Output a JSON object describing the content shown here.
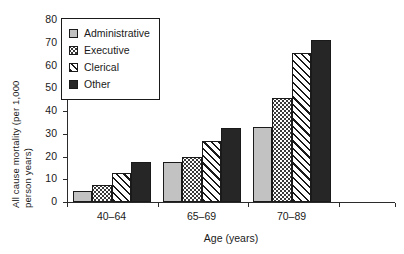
{
  "chart_data": {
    "type": "bar",
    "title": "",
    "xlabel": "Age (years)",
    "ylabel": "All cause mortality (per 1,000 person years)",
    "ylabel_line1": "All cause mortality (per 1,000",
    "ylabel_line2": "person years)",
    "categories": [
      "40–64",
      "65–69",
      "70–89"
    ],
    "ylim": [
      0,
      80
    ],
    "yticks": [
      0,
      10,
      20,
      30,
      40,
      50,
      60,
      70,
      80
    ],
    "ytick_labels": [
      "0",
      "10",
      "20",
      "30",
      "40",
      "50",
      "60",
      "70",
      "80"
    ],
    "grid": false,
    "legend_position": "upper-left-inside",
    "series": [
      {
        "name": "Administrative",
        "pattern": "solid-light-gray",
        "color": "#c2c2c2",
        "values": [
          4.8,
          17.6,
          33.0
        ]
      },
      {
        "name": "Executive",
        "pattern": "dotted",
        "color": "#ffffff",
        "values": [
          7.6,
          20.0,
          45.7
        ]
      },
      {
        "name": "Clerical",
        "pattern": "diagonal-hatch",
        "color": "#ffffff",
        "values": [
          12.7,
          27.0,
          65.5
        ]
      },
      {
        "name": "Other",
        "pattern": "solid-black",
        "color": "#262626",
        "values": [
          17.6,
          32.5,
          71.0
        ]
      }
    ]
  },
  "legend": {
    "items": [
      {
        "label": "Administrative",
        "swatch": "swatch-administrative"
      },
      {
        "label": "Executive",
        "swatch": "swatch-executive"
      },
      {
        "label": "Clerical",
        "swatch": "swatch-clerical"
      },
      {
        "label": "Other",
        "swatch": "swatch-other"
      }
    ]
  }
}
